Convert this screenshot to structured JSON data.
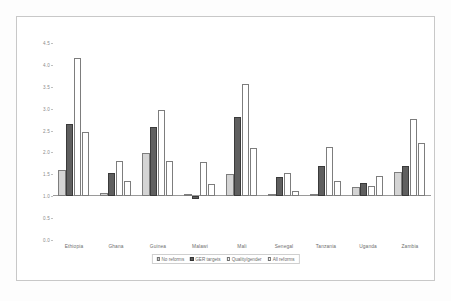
{
  "chart_data": {
    "type": "bar",
    "title": "",
    "subtitle": "",
    "xlabel": "",
    "ylabel": "",
    "ylim": [
      0.0,
      4.5
    ],
    "ytick_labels": [
      "4.5",
      "4.0",
      "3.5",
      "3.0",
      "2.5",
      "2.0",
      "1.5",
      "1.0",
      "0.5",
      "0.0"
    ],
    "ytick_values": [
      4.5,
      4.0,
      3.5,
      3.0,
      2.5,
      2.0,
      1.5,
      1.0,
      0.5,
      0.0
    ],
    "baseline": 1.0,
    "grid": false,
    "legend_position": "bottom",
    "categories": [
      "Ethiopia",
      "Ghana",
      "Guinea",
      "Malawi",
      "Mali",
      "Senegal",
      "Tanzania",
      "Uganda",
      "Zambia"
    ],
    "series": [
      {
        "name": "No reforms",
        "color": "#d4d4d4",
        "values": [
          1.61,
          1.08,
          1.99,
          1.01,
          1.5,
          1.02,
          1.03,
          1.21,
          1.56
        ]
      },
      {
        "name": "GER targets",
        "color": "#5f5f5f",
        "values": [
          2.66,
          1.54,
          2.58,
          0.93,
          2.8,
          1.44,
          1.69,
          1.31,
          1.68
        ]
      },
      {
        "name": "Quality/gender",
        "color": "#ffffff",
        "values": [
          4.15,
          1.81,
          2.97,
          1.78,
          3.57,
          1.53,
          2.12,
          1.24,
          2.76
        ]
      },
      {
        "name": "All reforms",
        "color": "#ffffff",
        "values": [
          2.47,
          1.34,
          1.81,
          1.27,
          2.1,
          1.13,
          1.34,
          1.46,
          2.21
        ]
      }
    ]
  },
  "legend": {
    "entries": [
      "No reforms",
      "GER targets",
      "Quality/gender",
      "All reforms"
    ]
  }
}
